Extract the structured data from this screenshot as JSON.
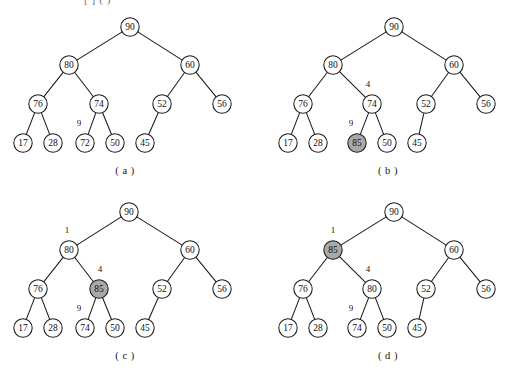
{
  "header": {
    "cropped_text": "[ ] (  )"
  },
  "figure": {
    "node_radius": 9.2,
    "shaded_color": "#a9a9a9",
    "plain_color": "#ffffff",
    "stroke_color": "#1a1a1a"
  },
  "panels": [
    {
      "id": "panel-a",
      "caption": "( a )",
      "caption_x": 125,
      "caption_y": 165,
      "origin_x": 0,
      "origin_y": 8,
      "nodes": [
        {
          "name": "node-90",
          "value": "90",
          "x": 130,
          "y": 19,
          "shaded": false
        },
        {
          "name": "node-80",
          "value": "80",
          "x": 69,
          "y": 57,
          "shaded": false
        },
        {
          "name": "node-60",
          "value": "60",
          "x": 190,
          "y": 57,
          "shaded": false
        },
        {
          "name": "node-76",
          "value": "76",
          "x": 38,
          "y": 96,
          "shaded": false
        },
        {
          "name": "node-74",
          "value": "74",
          "x": 99,
          "y": 96,
          "shaded": false
        },
        {
          "name": "node-52",
          "value": "52",
          "x": 162,
          "y": 96,
          "shaded": false
        },
        {
          "name": "node-56",
          "value": "56",
          "x": 222,
          "y": 96,
          "shaded": false
        },
        {
          "name": "node-17",
          "value": "17",
          "x": 23,
          "y": 135,
          "shaded": false
        },
        {
          "name": "node-28",
          "value": "28",
          "x": 53,
          "y": 135,
          "shaded": false
        },
        {
          "name": "node-72",
          "value": "72",
          "x": 85,
          "y": 135,
          "shaded": false
        },
        {
          "name": "node-50",
          "value": "50",
          "x": 115,
          "y": 135,
          "shaded": false
        },
        {
          "name": "node-45",
          "value": "45",
          "x": 145,
          "y": 135,
          "shaded": false
        }
      ],
      "edges": [
        [
          130,
          19,
          69,
          57
        ],
        [
          130,
          19,
          190,
          57
        ],
        [
          69,
          57,
          38,
          96
        ],
        [
          69,
          57,
          99,
          96
        ],
        [
          190,
          57,
          162,
          96
        ],
        [
          190,
          57,
          222,
          96
        ],
        [
          38,
          96,
          23,
          135
        ],
        [
          38,
          96,
          53,
          135
        ],
        [
          99,
          96,
          85,
          135
        ],
        [
          99,
          96,
          115,
          135
        ],
        [
          162,
          96,
          145,
          135
        ]
      ],
      "index_labels": [
        {
          "name": "index-label-9",
          "text": "9",
          "x": 79,
          "y": 115
        }
      ]
    },
    {
      "id": "panel-b",
      "caption": "( b )",
      "caption_x": 388,
      "caption_y": 165,
      "origin_x": 257,
      "origin_y": 8,
      "nodes": [
        {
          "name": "node-90",
          "value": "90",
          "x": 137,
          "y": 19,
          "shaded": false
        },
        {
          "name": "node-80",
          "value": "80",
          "x": 76,
          "y": 57,
          "shaded": false
        },
        {
          "name": "node-60",
          "value": "60",
          "x": 197,
          "y": 57,
          "shaded": false
        },
        {
          "name": "node-76",
          "value": "76",
          "x": 46,
          "y": 96,
          "shaded": false
        },
        {
          "name": "node-74",
          "value": "74",
          "x": 115,
          "y": 96,
          "shaded": false
        },
        {
          "name": "node-52",
          "value": "52",
          "x": 169,
          "y": 96,
          "shaded": false
        },
        {
          "name": "node-56",
          "value": "56",
          "x": 229,
          "y": 96,
          "shaded": false
        },
        {
          "name": "node-17",
          "value": "17",
          "x": 31,
          "y": 135,
          "shaded": false
        },
        {
          "name": "node-28",
          "value": "28",
          "x": 61,
          "y": 135,
          "shaded": false
        },
        {
          "name": "node-85",
          "value": "85",
          "x": 100,
          "y": 135,
          "shaded": true
        },
        {
          "name": "node-50",
          "value": "50",
          "x": 130,
          "y": 135,
          "shaded": false
        },
        {
          "name": "node-45",
          "value": "45",
          "x": 160,
          "y": 135,
          "shaded": false
        }
      ],
      "edges": [
        [
          137,
          19,
          76,
          57
        ],
        [
          137,
          19,
          197,
          57
        ],
        [
          76,
          57,
          46,
          96
        ],
        [
          76,
          57,
          115,
          96
        ],
        [
          197,
          57,
          169,
          96
        ],
        [
          197,
          57,
          229,
          96
        ],
        [
          46,
          96,
          31,
          135
        ],
        [
          46,
          96,
          61,
          135
        ],
        [
          115,
          96,
          100,
          135
        ],
        [
          115,
          96,
          130,
          135
        ],
        [
          169,
          96,
          160,
          135
        ]
      ],
      "index_labels": [
        {
          "name": "index-label-4",
          "text": "4",
          "x": 111,
          "y": 76
        },
        {
          "name": "index-label-9",
          "text": "9",
          "x": 94,
          "y": 115
        }
      ]
    },
    {
      "id": "panel-c",
      "caption": "( c )",
      "caption_x": 125,
      "caption_y": 350,
      "origin_x": 0,
      "origin_y": 193,
      "nodes": [
        {
          "name": "node-90",
          "value": "90",
          "x": 129,
          "y": 19,
          "shaded": false
        },
        {
          "name": "node-80",
          "value": "80",
          "x": 69,
          "y": 57,
          "shaded": false
        },
        {
          "name": "node-60",
          "value": "60",
          "x": 190,
          "y": 57,
          "shaded": false
        },
        {
          "name": "node-76",
          "value": "76",
          "x": 38,
          "y": 96,
          "shaded": false
        },
        {
          "name": "node-85",
          "value": "85",
          "x": 99,
          "y": 96,
          "shaded": true
        },
        {
          "name": "node-52",
          "value": "52",
          "x": 162,
          "y": 96,
          "shaded": false
        },
        {
          "name": "node-56",
          "value": "56",
          "x": 222,
          "y": 96,
          "shaded": false
        },
        {
          "name": "node-17",
          "value": "17",
          "x": 23,
          "y": 135,
          "shaded": false
        },
        {
          "name": "node-28",
          "value": "28",
          "x": 53,
          "y": 135,
          "shaded": false
        },
        {
          "name": "node-74",
          "value": "74",
          "x": 85,
          "y": 135,
          "shaded": false
        },
        {
          "name": "node-50",
          "value": "50",
          "x": 115,
          "y": 135,
          "shaded": false
        },
        {
          "name": "node-45",
          "value": "45",
          "x": 145,
          "y": 135,
          "shaded": false
        }
      ],
      "edges": [
        [
          129,
          19,
          69,
          57
        ],
        [
          129,
          19,
          190,
          57
        ],
        [
          69,
          57,
          38,
          96
        ],
        [
          69,
          57,
          99,
          96
        ],
        [
          190,
          57,
          162,
          96
        ],
        [
          190,
          57,
          222,
          96
        ],
        [
          38,
          96,
          23,
          135
        ],
        [
          38,
          96,
          53,
          135
        ],
        [
          99,
          96,
          85,
          135
        ],
        [
          99,
          96,
          115,
          135
        ],
        [
          162,
          96,
          145,
          135
        ]
      ],
      "index_labels": [
        {
          "name": "index-label-1",
          "text": "1",
          "x": 67,
          "y": 37
        },
        {
          "name": "index-label-4",
          "text": "4",
          "x": 100,
          "y": 76
        },
        {
          "name": "index-label-9",
          "text": "9",
          "x": 79,
          "y": 115
        }
      ]
    },
    {
      "id": "panel-d",
      "caption": "( d )",
      "caption_x": 388,
      "caption_y": 350,
      "origin_x": 257,
      "origin_y": 193,
      "nodes": [
        {
          "name": "node-90",
          "value": "90",
          "x": 137,
          "y": 19,
          "shaded": false
        },
        {
          "name": "node-85",
          "value": "85",
          "x": 76,
          "y": 57,
          "shaded": true
        },
        {
          "name": "node-60",
          "value": "60",
          "x": 197,
          "y": 57,
          "shaded": false
        },
        {
          "name": "node-76",
          "value": "76",
          "x": 46,
          "y": 96,
          "shaded": false
        },
        {
          "name": "node-80",
          "value": "80",
          "x": 115,
          "y": 96,
          "shaded": false
        },
        {
          "name": "node-52",
          "value": "52",
          "x": 169,
          "y": 96,
          "shaded": false
        },
        {
          "name": "node-56",
          "value": "56",
          "x": 229,
          "y": 96,
          "shaded": false
        },
        {
          "name": "node-17",
          "value": "17",
          "x": 31,
          "y": 135,
          "shaded": false
        },
        {
          "name": "node-28",
          "value": "28",
          "x": 61,
          "y": 135,
          "shaded": false
        },
        {
          "name": "node-74",
          "value": "74",
          "x": 100,
          "y": 135,
          "shaded": false
        },
        {
          "name": "node-50",
          "value": "50",
          "x": 130,
          "y": 135,
          "shaded": false
        },
        {
          "name": "node-45",
          "value": "45",
          "x": 160,
          "y": 135,
          "shaded": false
        }
      ],
      "edges": [
        [
          137,
          19,
          76,
          57
        ],
        [
          137,
          19,
          197,
          57
        ],
        [
          76,
          57,
          46,
          96
        ],
        [
          76,
          57,
          115,
          96
        ],
        [
          197,
          57,
          169,
          96
        ],
        [
          197,
          57,
          229,
          96
        ],
        [
          46,
          96,
          31,
          135
        ],
        [
          46,
          96,
          61,
          135
        ],
        [
          115,
          96,
          100,
          135
        ],
        [
          115,
          96,
          130,
          135
        ],
        [
          169,
          96,
          160,
          135
        ]
      ],
      "index_labels": [
        {
          "name": "index-label-1",
          "text": "1",
          "x": 76,
          "y": 37
        },
        {
          "name": "index-label-4",
          "text": "4",
          "x": 111,
          "y": 76
        },
        {
          "name": "index-label-9",
          "text": "9",
          "x": 94,
          "y": 115
        }
      ]
    }
  ]
}
